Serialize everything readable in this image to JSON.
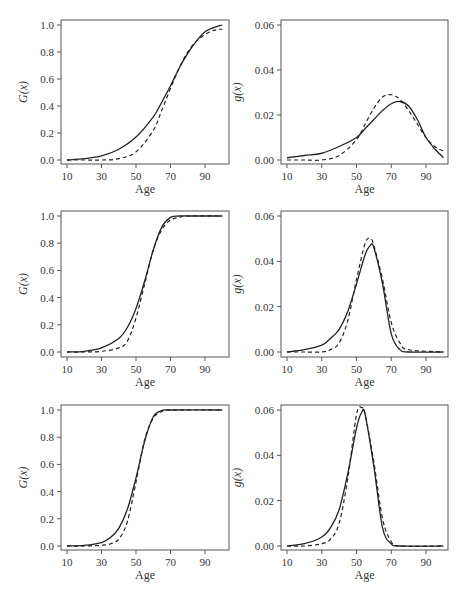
{
  "chart_data": [
    {
      "type": "line",
      "panel": "row1-left",
      "title": "",
      "xlabel": "Age",
      "ylabel": "G(x)",
      "xticks": [
        10,
        30,
        50,
        70,
        90
      ],
      "yticks": [
        0.0,
        0.2,
        0.4,
        0.6,
        0.8,
        1.0
      ],
      "ytick_labels": [
        "0.0",
        "0.2",
        "0.4",
        "0.6",
        "0.8",
        "1.0"
      ],
      "xlim": [
        10,
        100
      ],
      "ylim": [
        0,
        1
      ],
      "x": [
        10,
        20,
        30,
        40,
        50,
        60,
        65,
        70,
        75,
        80,
        85,
        90,
        95,
        100
      ],
      "series": [
        {
          "name": "solid",
          "style": "solid",
          "values": [
            0.0,
            0.01,
            0.03,
            0.08,
            0.17,
            0.32,
            0.43,
            0.55,
            0.68,
            0.79,
            0.88,
            0.95,
            0.98,
            1.0
          ]
        },
        {
          "name": "dashed",
          "style": "dashed",
          "values": [
            0.0,
            0.0,
            0.0,
            0.01,
            0.06,
            0.22,
            0.37,
            0.53,
            0.68,
            0.8,
            0.88,
            0.93,
            0.96,
            0.97
          ]
        }
      ]
    },
    {
      "type": "line",
      "panel": "row1-right",
      "title": "",
      "xlabel": "Age",
      "ylabel": "g(x)",
      "xticks": [
        10,
        30,
        50,
        70,
        90
      ],
      "yticks": [
        0.0,
        0.02,
        0.04,
        0.06
      ],
      "ytick_labels": [
        "0.00",
        "0.02",
        "0.04",
        "0.06"
      ],
      "xlim": [
        10,
        100
      ],
      "ylim": [
        0,
        0.06
      ],
      "x": [
        10,
        20,
        30,
        40,
        50,
        55,
        60,
        65,
        70,
        75,
        80,
        85,
        90,
        95,
        100
      ],
      "series": [
        {
          "name": "solid",
          "style": "solid",
          "values": [
            0.001,
            0.002,
            0.003,
            0.006,
            0.01,
            0.014,
            0.018,
            0.022,
            0.025,
            0.026,
            0.024,
            0.018,
            0.01,
            0.005,
            0.001
          ]
        },
        {
          "name": "dashed",
          "style": "dashed",
          "values": [
            0.0,
            0.0,
            0.0,
            0.002,
            0.009,
            0.016,
            0.023,
            0.028,
            0.029,
            0.027,
            0.022,
            0.016,
            0.01,
            0.006,
            0.004
          ]
        }
      ]
    },
    {
      "type": "line",
      "panel": "row2-left",
      "title": "",
      "xlabel": "Age",
      "ylabel": "G(x)",
      "xticks": [
        10,
        30,
        50,
        70,
        90
      ],
      "yticks": [
        0.0,
        0.2,
        0.4,
        0.6,
        0.8,
        1.0
      ],
      "ytick_labels": [
        "0.0",
        "0.2",
        "0.4",
        "0.6",
        "0.8",
        "1.0"
      ],
      "xlim": [
        10,
        100
      ],
      "ylim": [
        0,
        1
      ],
      "x": [
        10,
        20,
        30,
        40,
        45,
        50,
        55,
        60,
        65,
        70,
        75,
        80,
        100
      ],
      "series": [
        {
          "name": "solid",
          "style": "solid",
          "values": [
            0.0,
            0.005,
            0.03,
            0.1,
            0.18,
            0.32,
            0.52,
            0.75,
            0.92,
            0.99,
            1.0,
            1.0,
            1.0
          ]
        },
        {
          "name": "dashed",
          "style": "dashed",
          "values": [
            0.0,
            0.0,
            0.005,
            0.03,
            0.08,
            0.25,
            0.5,
            0.75,
            0.9,
            0.97,
            0.99,
            1.0,
            1.0
          ]
        }
      ]
    },
    {
      "type": "line",
      "panel": "row2-right",
      "title": "",
      "xlabel": "Age",
      "ylabel": "g(x)",
      "xticks": [
        10,
        30,
        50,
        70,
        90
      ],
      "yticks": [
        0.0,
        0.02,
        0.04,
        0.06
      ],
      "ytick_labels": [
        "0.00",
        "0.02",
        "0.04",
        "0.06"
      ],
      "xlim": [
        10,
        100
      ],
      "ylim": [
        0,
        0.06
      ],
      "x": [
        10,
        20,
        30,
        35,
        40,
        45,
        50,
        55,
        58,
        60,
        65,
        70,
        75,
        80,
        100
      ],
      "series": [
        {
          "name": "solid",
          "style": "solid",
          "values": [
            0.0,
            0.001,
            0.003,
            0.006,
            0.01,
            0.018,
            0.03,
            0.043,
            0.047,
            0.046,
            0.03,
            0.008,
            0.001,
            0.0,
            0.0
          ]
        },
        {
          "name": "dashed",
          "style": "dashed",
          "values": [
            0.0,
            0.0,
            0.0,
            0.001,
            0.004,
            0.014,
            0.032,
            0.048,
            0.05,
            0.047,
            0.032,
            0.013,
            0.004,
            0.001,
            0.0
          ]
        }
      ]
    },
    {
      "type": "line",
      "panel": "row3-left",
      "title": "",
      "xlabel": "Age",
      "ylabel": "G(x)",
      "xticks": [
        10,
        30,
        50,
        70,
        90
      ],
      "yticks": [
        0.0,
        0.2,
        0.4,
        0.6,
        0.8,
        1.0
      ],
      "ytick_labels": [
        "0.0",
        "0.2",
        "0.4",
        "0.6",
        "0.8",
        "1.0"
      ],
      "xlim": [
        10,
        100
      ],
      "ylim": [
        0,
        1
      ],
      "x": [
        10,
        20,
        30,
        35,
        40,
        45,
        50,
        55,
        60,
        65,
        70,
        100
      ],
      "series": [
        {
          "name": "solid",
          "style": "solid",
          "values": [
            0.0,
            0.004,
            0.025,
            0.06,
            0.13,
            0.27,
            0.5,
            0.77,
            0.95,
            0.995,
            1.0,
            1.0
          ]
        },
        {
          "name": "dashed",
          "style": "dashed",
          "values": [
            0.0,
            0.0,
            0.005,
            0.015,
            0.05,
            0.18,
            0.47,
            0.78,
            0.94,
            0.99,
            1.0,
            1.0
          ]
        }
      ]
    },
    {
      "type": "line",
      "panel": "row3-right",
      "title": "",
      "xlabel": "Age",
      "ylabel": "g(x)",
      "xticks": [
        10,
        30,
        50,
        70,
        90
      ],
      "yticks": [
        0.0,
        0.02,
        0.04,
        0.06
      ],
      "ytick_labels": [
        "0.00",
        "0.02",
        "0.04",
        "0.06"
      ],
      "xlim": [
        10,
        100
      ],
      "ylim": [
        0,
        0.06
      ],
      "x": [
        10,
        20,
        30,
        35,
        40,
        45,
        50,
        53,
        55,
        60,
        65,
        70,
        75,
        100
      ],
      "series": [
        {
          "name": "solid",
          "style": "solid",
          "values": [
            0.0,
            0.001,
            0.004,
            0.008,
            0.016,
            0.032,
            0.052,
            0.059,
            0.058,
            0.035,
            0.008,
            0.001,
            0.0,
            0.0
          ]
        },
        {
          "name": "dashed",
          "style": "dashed",
          "values": [
            0.0,
            0.0,
            0.001,
            0.003,
            0.01,
            0.03,
            0.058,
            0.061,
            0.058,
            0.037,
            0.012,
            0.002,
            0.0,
            0.0
          ]
        }
      ]
    }
  ]
}
